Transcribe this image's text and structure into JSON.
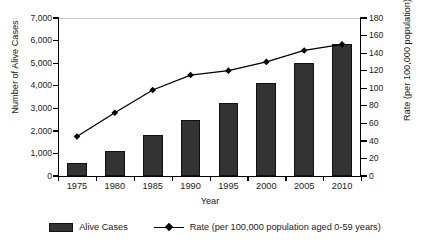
{
  "chart_data": {
    "type": "bar",
    "title": "",
    "xlabel": "Year",
    "ylabel": "Number of Alive Cases",
    "y2label": "Rate (per 100,000 population)",
    "categories": [
      "1975",
      "1980",
      "1985",
      "1990",
      "1995",
      "2000",
      "2005",
      "2010"
    ],
    "ylim": [
      0,
      7000
    ],
    "y2lim": [
      0,
      180
    ],
    "yticks": [
      "0",
      "1,000",
      "2,000",
      "3,000",
      "4,000",
      "5,000",
      "6,000",
      "7,000"
    ],
    "ytick_values": [
      0,
      1000,
      2000,
      3000,
      4000,
      5000,
      6000,
      7000
    ],
    "y2ticks": [
      "0",
      "20",
      "40",
      "60",
      "80",
      "100",
      "120",
      "140",
      "160",
      "180"
    ],
    "y2tick_values": [
      0,
      20,
      40,
      60,
      80,
      100,
      120,
      140,
      160,
      180
    ],
    "grid": false,
    "legend_position": "bottom",
    "series": [
      {
        "name": "Alive Cases",
        "type": "bar",
        "axis": "left",
        "color": "#333333",
        "values": [
          580,
          1120,
          1800,
          2500,
          3250,
          4120,
          5000,
          5850
        ]
      },
      {
        "name": "Rate (per 100,000 population aged 0-59 years)",
        "type": "line",
        "axis": "right",
        "color": "#000000",
        "marker": "diamond",
        "values": [
          45,
          72,
          98,
          115,
          120,
          130,
          143,
          150
        ]
      }
    ]
  },
  "legend": {
    "items": [
      {
        "label": "Alive Cases",
        "marker": "bar-swatch"
      },
      {
        "label": "Rate (per 100,000 population aged 0-59 years)",
        "marker": "line-diamond-swatch"
      }
    ]
  },
  "axes": {
    "left_title": "Number of Alive Cases",
    "right_title": "Rate (per 100,000 population)",
    "x_title": "Year"
  }
}
